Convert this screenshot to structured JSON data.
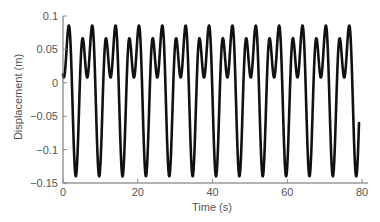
{
  "chart_data": {
    "type": "line",
    "title": "",
    "xlabel": "Time (s)",
    "ylabel": "Displacement (m)",
    "xlim": [
      0,
      80
    ],
    "ylim": [
      -0.15,
      0.1
    ],
    "xticks": [
      0,
      20,
      40,
      60,
      80
    ],
    "xtick_labels": [
      "0",
      "20",
      "40",
      "60",
      "80"
    ],
    "yticks": [
      -0.15,
      -0.1,
      -0.05,
      0,
      0.05,
      0.1
    ],
    "ytick_labels": [
      "−0.15",
      "−0.1",
      "−0.05",
      "0",
      "0.05",
      "0.1"
    ],
    "grid": false,
    "legend": null,
    "series": [
      {
        "name": "displacement",
        "color": "#111111",
        "t_start": 0,
        "t_end": 79.2,
        "description": "Periodic two-harmonic oscillation, period ~6.25 s; alternating peaks ~0.085 m and ~0.066 m, shallow dip ~0.007 m between them, deep minima ~-0.14 m",
        "model": {
          "omega": 1.005,
          "t_min": 3.4,
          "offset": 0.0,
          "a1_cos": -0.074,
          "a2_cos": -0.0658,
          "a1_sin": -0.0099
        },
        "extrema_first_cycle": [
          {
            "t": 0.0,
            "y": 0.01
          },
          {
            "t": 1.1,
            "y": 0.085
          },
          {
            "t": 3.4,
            "y": -0.14
          },
          {
            "t": 5.3,
            "y": 0.066
          },
          {
            "t": 6.2,
            "y": 0.007
          },
          {
            "t": 7.5,
            "y": 0.085
          }
        ],
        "end_point": {
          "t": 79.2,
          "y": -0.075
        }
      }
    ]
  }
}
